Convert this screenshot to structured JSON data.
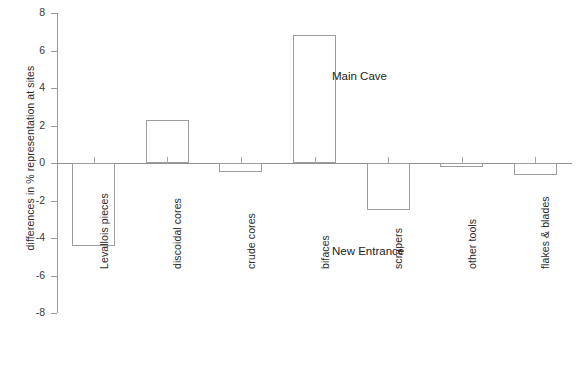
{
  "chart_data": {
    "type": "bar",
    "title": "",
    "xlabel": "",
    "ylabel": "differences in % representation at sites",
    "categories": [
      "Levallois pieces",
      "discoidal cores",
      "crude cores",
      "bifaces",
      "scrapers",
      "other tools",
      "flakes & blades"
    ],
    "values": [
      -4.4,
      2.3,
      -0.5,
      6.85,
      -2.5,
      -0.2,
      -0.65
    ],
    "ylim": [
      -8,
      8
    ],
    "yticks": [
      8,
      6,
      4,
      2,
      0,
      -2,
      -4,
      -6,
      -8
    ],
    "ytick_labels": [
      "8",
      "6",
      "4",
      "2",
      "0",
      "-2",
      "-4",
      "-6",
      "-8"
    ],
    "grid": false,
    "legend": "none",
    "annotations": [
      {
        "text": "Main Cave",
        "x_value": 3.5,
        "y_value": 5.5
      },
      {
        "text": "New Entrance",
        "x_value": 3.5,
        "y_value": -4.5
      }
    ],
    "series": [
      {
        "name": "difference in % representation",
        "values": [
          -4.4,
          2.3,
          -0.5,
          6.85,
          -2.5,
          -0.2,
          -0.65
        ]
      }
    ],
    "bar_style": {
      "fill": "none",
      "edge_color": "#9d9d9d"
    }
  },
  "axis": {
    "y_title": "differences in % representation at sites"
  }
}
